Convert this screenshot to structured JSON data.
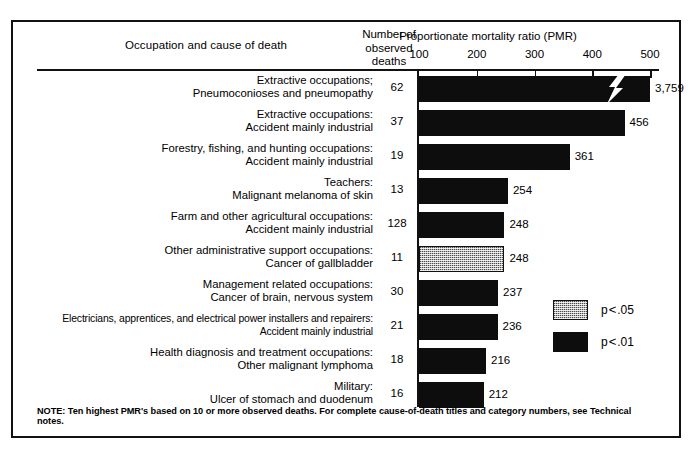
{
  "header": {
    "occupation_col": "Occupation and cause of death",
    "number_observed_line1": "Number of",
    "number_observed_line2": "observed",
    "number_observed_line3": "deaths",
    "pmr_title": "Proportionate mortality ratio (PMR)"
  },
  "note": "NOTE: Ten highest PMR's based on 10 or more observed deaths. For complete cause-of-death titles and category numbers, see Technical notes.",
  "legend": [
    {
      "label_prefix": "p",
      "label_op": "<",
      "label_value": ".05",
      "style": "stipple",
      "text": "p < .05"
    },
    {
      "label_prefix": "p",
      "label_op": "<",
      "label_value": ".01",
      "style": "solid",
      "text": "p < .01"
    }
  ],
  "chart_data": {
    "type": "bar",
    "orientation": "horizontal",
    "title": "Proportionate mortality ratio (PMR)",
    "xlabel": "Proportionate mortality ratio (PMR)",
    "ylabel": "Occupation and cause of death",
    "xlim": [
      100,
      500
    ],
    "xticks": [
      100,
      200,
      300,
      400,
      500
    ],
    "xticklabels": [
      "100",
      "200",
      "300",
      "400",
      "500"
    ],
    "grid": false,
    "legend_position": "right-middle",
    "baseline": 100,
    "note_about_break": "Top bar is axis-broken (lightning-bolt break); true value 3,759 exceeds the 500 axis maximum.",
    "columns": [
      "Occupation and cause of death",
      "Number of observed deaths",
      "PMR"
    ],
    "categories": [
      "Extractive occupations; Pneumoconioses and pneumopathy",
      "Extractive occupations: Accident mainly industrial",
      "Forestry, fishing, and hunting occupations: Accident mainly industrial",
      "Teachers: Malignant melanoma of skin",
      "Farm and other agricultural occupations: Accident mainly industrial",
      "Other administrative support occupations: Cancer of gallbladder",
      "Management related occupations: Cancer of brain, nervous system",
      "Electricians, apprentices, and electrical power installers and repairers: Accident mainly industrial",
      "Health diagnosis and treatment occupations: Other malignant lymphoma",
      "Military: Ulcer of stomach and duodenum"
    ],
    "values": [
      3759,
      456,
      361,
      254,
      248,
      248,
      237,
      236,
      216,
      212
    ],
    "observed_deaths": [
      62,
      37,
      19,
      13,
      128,
      11,
      30,
      21,
      18,
      16
    ],
    "rows": [
      {
        "occupation": "Extractive occupations;",
        "cause": "Pneumoconioses and pneumopathy",
        "deaths": "62",
        "pmr": 3759,
        "pmr_label": "3,759",
        "style": "solid",
        "broken": true,
        "significance": "p < .01",
        "tight": false
      },
      {
        "occupation": "Extractive occupations:",
        "cause": "Accident mainly industrial",
        "deaths": "37",
        "pmr": 456,
        "pmr_label": "456",
        "style": "solid",
        "broken": false,
        "significance": "p < .01",
        "tight": false
      },
      {
        "occupation": "Forestry, fishing, and hunting occupations:",
        "cause": "Accident mainly industrial",
        "deaths": "19",
        "pmr": 361,
        "pmr_label": "361",
        "style": "solid",
        "broken": false,
        "significance": "p < .01",
        "tight": false
      },
      {
        "occupation": "Teachers:",
        "cause": "Malignant melanoma of skin",
        "deaths": "13",
        "pmr": 254,
        "pmr_label": "254",
        "style": "solid",
        "broken": false,
        "significance": "p < .01",
        "tight": false
      },
      {
        "occupation": "Farm and other agricultural occupations:",
        "cause": "Accident mainly industrial",
        "deaths": "128",
        "pmr": 248,
        "pmr_label": "248",
        "style": "solid",
        "broken": false,
        "significance": "p < .01",
        "tight": false
      },
      {
        "occupation": "Other administrative support occupations:",
        "cause": "Cancer of gallbladder",
        "deaths": "11",
        "pmr": 248,
        "pmr_label": "248",
        "style": "stipple",
        "broken": false,
        "significance": "p < .05",
        "tight": false
      },
      {
        "occupation": "Management related occupations:",
        "cause": "Cancer of brain, nervous system",
        "deaths": "30",
        "pmr": 237,
        "pmr_label": "237",
        "style": "solid",
        "broken": false,
        "significance": "p < .01",
        "tight": false
      },
      {
        "occupation": "Electricians, apprentices, and electrical power installers and repairers:",
        "cause": "Accident mainly industrial",
        "deaths": "21",
        "pmr": 236,
        "pmr_label": "236",
        "style": "solid",
        "broken": false,
        "significance": "p < .01",
        "tight": true
      },
      {
        "occupation": "Health diagnosis and treatment occupations:",
        "cause": "Other malignant lymphoma",
        "deaths": "18",
        "pmr": 216,
        "pmr_label": "216",
        "style": "solid",
        "broken": false,
        "significance": "p < .01",
        "tight": false
      },
      {
        "occupation": "Military:",
        "cause": "Ulcer of stomach and duodenum",
        "deaths": "16",
        "pmr": 212,
        "pmr_label": "212",
        "style": "solid",
        "broken": false,
        "significance": "p < .01",
        "tight": false
      }
    ]
  }
}
